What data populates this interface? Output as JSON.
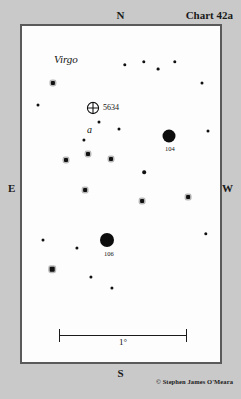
{
  "chart": {
    "title": "Chart 42a",
    "constellation": "Virgo",
    "copyright": "© Stephen James O'Meara",
    "cardinals": {
      "north": "N",
      "south": "S",
      "east": "E",
      "west": "W"
    }
  },
  "scale": {
    "label": "1°"
  },
  "chart_data": {
    "type": "scatter",
    "title": "Chart 42a",
    "subtitle": "Virgo",
    "xlabel": "",
    "ylabel": "",
    "grid": false,
    "legend_position": "none",
    "orientation": {
      "top": "N",
      "bottom": "S",
      "left": "E",
      "right": "W"
    },
    "scale_bar_degrees": 1,
    "field_width_px": 202,
    "field_height_px": 340,
    "deep_sky_objects": [
      {
        "name": "5634",
        "symbol": "globular-cluster",
        "x": 71,
        "y": 81,
        "size": 13,
        "label": "5634",
        "label_dx": 10,
        "label_dy": -4
      },
      {
        "name": "104",
        "symbol": "filled-disk",
        "x": 147,
        "y": 110,
        "size": 13,
        "label": "104",
        "label_dx": -4,
        "label_dy": 9
      },
      {
        "name": "106",
        "symbol": "filled-disk",
        "x": 85,
        "y": 214,
        "size": 14,
        "label": "106",
        "label_dx": -3,
        "label_dy": 10
      }
    ],
    "lettered_stars": [
      {
        "letter": "a",
        "x": 65,
        "y": 98
      }
    ],
    "stars": [
      {
        "x": 103,
        "y": 39,
        "size": 3.4,
        "halo": false
      },
      {
        "x": 122,
        "y": 36,
        "size": 3.4,
        "halo": false
      },
      {
        "x": 136,
        "y": 43,
        "size": 2.8,
        "halo": false
      },
      {
        "x": 153,
        "y": 36,
        "size": 3.4,
        "halo": false
      },
      {
        "x": 31,
        "y": 57,
        "size": 4.2,
        "halo": true
      },
      {
        "x": 180,
        "y": 57,
        "size": 3.0,
        "halo": false
      },
      {
        "x": 16,
        "y": 79,
        "size": 3.0,
        "halo": false
      },
      {
        "x": 77,
        "y": 96,
        "size": 3.0,
        "halo": false
      },
      {
        "x": 97,
        "y": 103,
        "size": 3.0,
        "halo": false
      },
      {
        "x": 186,
        "y": 105,
        "size": 3.0,
        "halo": false
      },
      {
        "x": 62,
        "y": 114,
        "size": 3.2,
        "halo": false
      },
      {
        "x": 66,
        "y": 128,
        "size": 4.0,
        "halo": true
      },
      {
        "x": 44,
        "y": 134,
        "size": 4.0,
        "halo": true
      },
      {
        "x": 89,
        "y": 133,
        "size": 4.0,
        "halo": true
      },
      {
        "x": 122,
        "y": 146,
        "size": 3.6,
        "halo": false
      },
      {
        "x": 63,
        "y": 164,
        "size": 3.8,
        "halo": true
      },
      {
        "x": 120,
        "y": 175,
        "size": 3.8,
        "halo": true
      },
      {
        "x": 166,
        "y": 171,
        "size": 3.8,
        "halo": true
      },
      {
        "x": 184,
        "y": 208,
        "size": 3.4,
        "halo": false
      },
      {
        "x": 55,
        "y": 222,
        "size": 3.2,
        "halo": false
      },
      {
        "x": 30,
        "y": 243,
        "size": 4.6,
        "halo": true
      },
      {
        "x": 69,
        "y": 251,
        "size": 3.2,
        "halo": false
      },
      {
        "x": 90,
        "y": 262,
        "size": 3.2,
        "halo": false
      },
      {
        "x": 21,
        "y": 214,
        "size": 3.0,
        "halo": false
      }
    ]
  }
}
